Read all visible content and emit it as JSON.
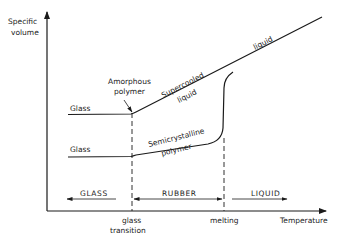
{
  "diagram": {
    "type": "specific-volume-vs-temperature",
    "y_axis": {
      "label_line1": "Specific",
      "label_line2": "volume"
    },
    "x_axis": {
      "label": "Temperature"
    },
    "x_ticks": [
      {
        "label_line1": "glass",
        "label_line2": "transition"
      },
      {
        "label_line1": "melting"
      }
    ],
    "curves": [
      {
        "name": "amorphous",
        "start_label": "Glass",
        "annotation_line1": "Amorphous",
        "annotation_line2": "polymer"
      },
      {
        "name": "semicrystalline",
        "start_label": "Glass",
        "annotation_line1": "Semicrystalline",
        "annotation_line2": "polymer"
      }
    ],
    "curve_labels": {
      "supercooled_line1": "Supercooled",
      "supercooled_line2": "liquid",
      "liquid": "liquid"
    },
    "regions": [
      {
        "label": "GLASS"
      },
      {
        "label": "RUBBER"
      },
      {
        "label": "LIQUID"
      }
    ],
    "colors": {
      "line": "#1a1a1a",
      "text": "#222222",
      "background": "#ffffff"
    }
  }
}
